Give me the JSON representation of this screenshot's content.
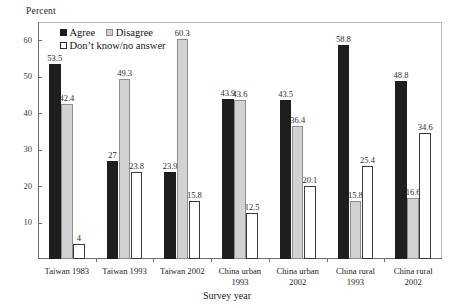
{
  "chart_data": {
    "type": "bar",
    "title": "",
    "ylabel": "Percent",
    "xlabel": "Survey year",
    "ylim": [
      0,
      65
    ],
    "yticks": [
      10,
      20,
      30,
      40,
      50,
      60
    ],
    "grid": false,
    "legend_position": "top-left-inside",
    "categories": [
      "Taiwan 1983",
      "Taiwan 1993",
      "Taiwan 2002",
      "China urban\n1993",
      "China urban\n2002",
      "China rural\n1993",
      "China rural\n2002"
    ],
    "series": [
      {
        "name": "Agree",
        "color": "#1e1e1e",
        "values": [
          53.5,
          27,
          23.9,
          43.9,
          43.5,
          58.8,
          48.8
        ],
        "labels": [
          "53.5",
          "27",
          "23.9",
          "43.9",
          "43.5",
          "58.8",
          "48.8"
        ]
      },
      {
        "name": "Disagree",
        "color": "#d2d2d2",
        "values": [
          42.4,
          49.3,
          60.3,
          43.6,
          36.4,
          15.8,
          16.6
        ],
        "labels": [
          "42.4",
          "49.3",
          "60.3",
          "43.6",
          "36.4",
          "15.8",
          "16.6"
        ]
      },
      {
        "name": "Don't know/no answer",
        "color": "#ffffff",
        "values": [
          4,
          23.8,
          15.8,
          12.5,
          20.1,
          25.4,
          34.6
        ],
        "labels": [
          "4",
          "23.8",
          "15.8",
          "12.5",
          "20.1",
          "25.4",
          "34.6"
        ]
      }
    ]
  },
  "legend": {
    "agree": "Agree",
    "disagree": "Disagree",
    "dont_know": "Don’t know/no answer"
  },
  "axis": {
    "y_title": "Percent",
    "x_title": "Survey year"
  }
}
